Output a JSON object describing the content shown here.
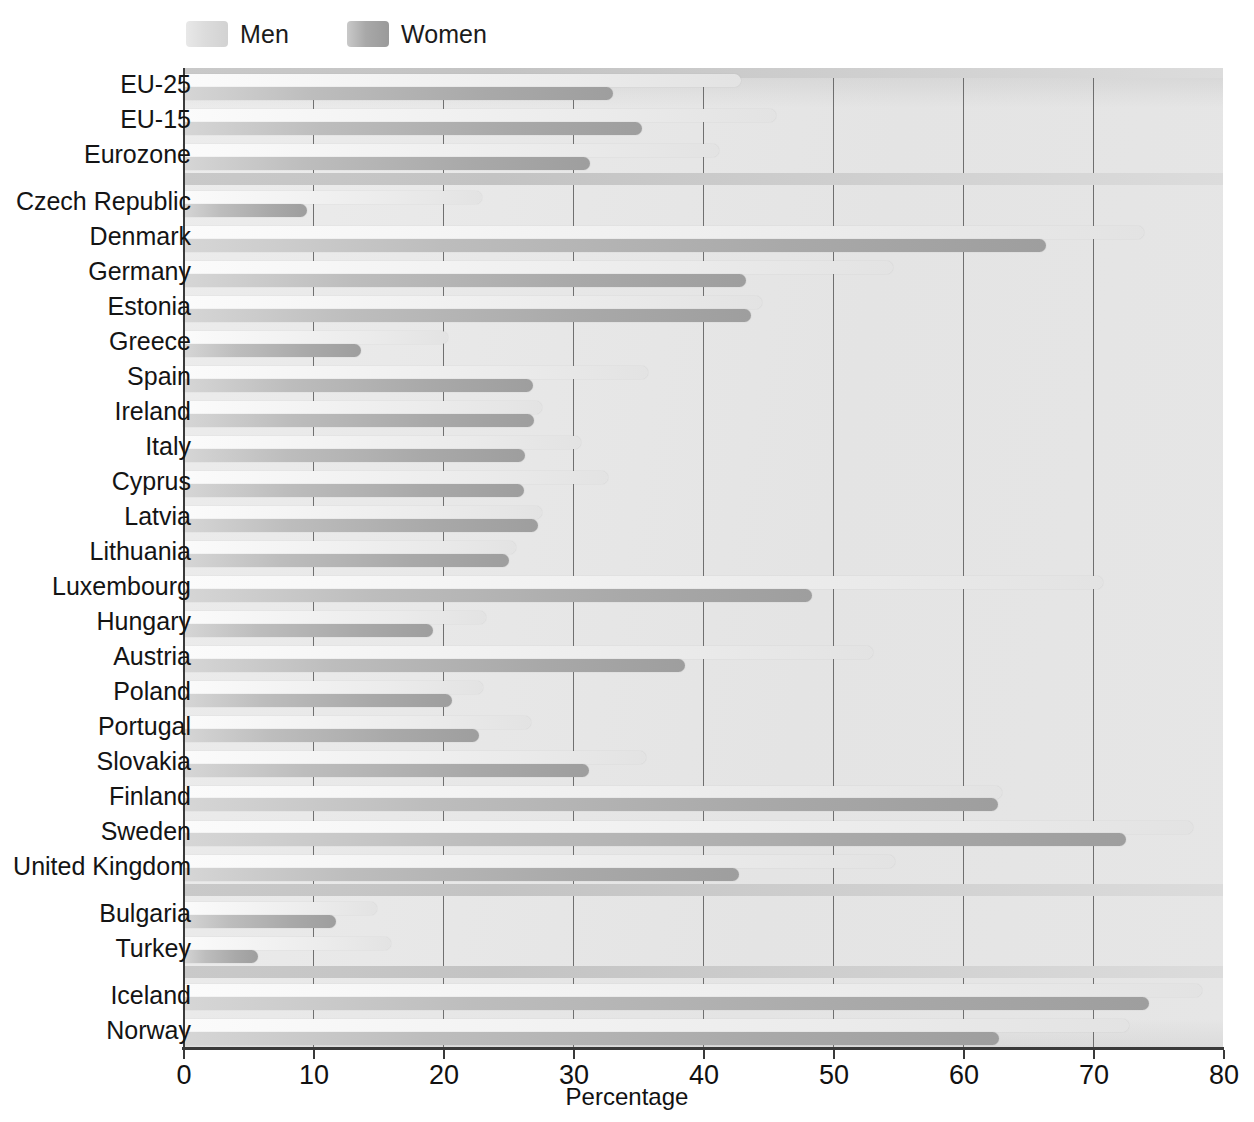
{
  "legend": {
    "items": [
      {
        "key": "men",
        "label": "Men",
        "color": "#e8e8e8"
      },
      {
        "key": "women",
        "label": "Women",
        "color": "#a8a8a8"
      }
    ]
  },
  "axis": {
    "x_title": "Percentage",
    "ticks": [
      0,
      10,
      20,
      30,
      40,
      50,
      60,
      70,
      80
    ],
    "tick_labels": [
      "0",
      "10",
      "20",
      "30",
      "40",
      "50",
      "60",
      "70",
      "80"
    ]
  },
  "chart_data": {
    "type": "bar",
    "orientation": "horizontal",
    "title": "",
    "xlabel": "Percentage",
    "ylabel": "",
    "xlim": [
      0,
      80
    ],
    "grid": true,
    "legend_position": "top-left",
    "categories": [
      "EU-25",
      "EU-15",
      "Eurozone",
      "Czech Republic",
      "Denmark",
      "Germany",
      "Estonia",
      "Greece",
      "Spain",
      "Ireland",
      "Italy",
      "Cyprus",
      "Latvia",
      "Lithuania",
      "Luxembourg",
      "Hungary",
      "Austria",
      "Poland",
      "Portugal",
      "Slovakia",
      "Finland",
      "Sweden",
      "United Kingdom",
      "Bulgaria",
      "Turkey",
      "Iceland",
      "Norway"
    ],
    "series": [
      {
        "name": "Men",
        "color": "#ebebeb",
        "values": [
          42.9,
          45.6,
          41.2,
          23.0,
          73.9,
          54.6,
          44.5,
          20.4,
          35.8,
          27.6,
          30.6,
          32.7,
          27.6,
          25.6,
          70.8,
          23.3,
          53.1,
          23.1,
          26.8,
          35.6,
          63.0,
          77.7,
          54.8,
          14.9,
          16.0,
          78.4,
          72.8
        ]
      },
      {
        "name": "Women",
        "color": "#a9a9a9",
        "values": [
          33.1,
          35.3,
          31.3,
          9.5,
          66.4,
          43.3,
          43.7,
          13.7,
          26.9,
          27.0,
          26.3,
          26.2,
          27.3,
          25.1,
          48.4,
          19.2,
          38.6,
          20.7,
          22.8,
          31.2,
          62.7,
          72.5,
          42.8,
          11.8,
          5.8,
          74.3,
          62.8
        ]
      }
    ],
    "group_separators": [
      2,
      22,
      24
    ]
  }
}
